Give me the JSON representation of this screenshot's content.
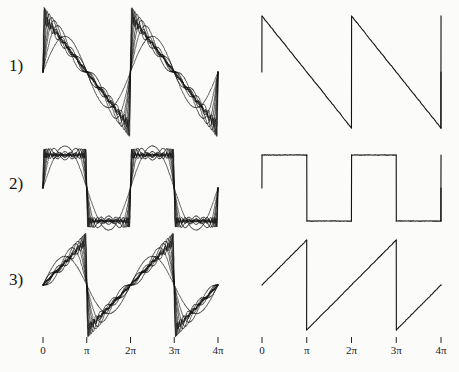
{
  "figure": {
    "background_color": "#fbfbfa",
    "ink_color": "#111111",
    "rows": [
      {
        "label": "1)",
        "name": "falling-sawtooth",
        "left_caption": "Fourier partial sums of a falling sawtooth wave showing Gibbs overshoot",
        "right_caption": "Ideal falling sawtooth wave"
      },
      {
        "label": "2)",
        "name": "square-wave",
        "left_caption": "Fourier partial sums of a square wave showing Gibbs overshoot",
        "right_caption": "Ideal square wave"
      },
      {
        "label": "3)",
        "name": "rising-sawtooth",
        "left_caption": "Fourier partial sums of a rising sawtooth wave showing Gibbs overshoot",
        "right_caption": "Ideal rising sawtooth wave"
      }
    ],
    "axis": {
      "tick_labels": [
        "0",
        "π",
        "2π",
        "3π",
        "4π"
      ],
      "tick_values": [
        0,
        3.14159,
        6.28319,
        9.42478,
        12.56637
      ],
      "xlabel": "",
      "ylabel": ""
    }
  },
  "chart_data": [
    {
      "id": "row1-left",
      "type": "line",
      "title": "",
      "xlabel": "",
      "ylabel": "",
      "xlim": [
        0,
        12.56637
      ],
      "ylim": [
        -1.35,
        1.35
      ],
      "grid": false,
      "legend": null,
      "xticks": [
        0,
        3.14159,
        6.28319,
        9.42478,
        12.56637
      ],
      "xticklabels": [
        "0",
        "π",
        "2π",
        "3π",
        "4π"
      ],
      "description": "Fourier series partial sums (N = 1,2,3,5,8,13,21,34) converging to a falling sawtooth wave, period 2π, with visible Gibbs phenomenon spikes at the jump discontinuities",
      "waveform": "falling-sawtooth",
      "period": 6.28319,
      "amplitude": 1.0,
      "harmonics": [
        1,
        2,
        3,
        5,
        8,
        13,
        21,
        34
      ]
    },
    {
      "id": "row1-right",
      "type": "line",
      "title": "",
      "xlabel": "",
      "ylabel": "",
      "xlim": [
        0,
        12.56637
      ],
      "ylim": [
        -1.35,
        1.35
      ],
      "grid": false,
      "legend": null,
      "xticks": [
        0,
        3.14159,
        6.28319,
        9.42478,
        12.56637
      ],
      "xticklabels": [
        "0",
        "π",
        "2π",
        "3π",
        "4π"
      ],
      "description": "Ideal falling sawtooth wave, period 2π, rising jump at x = 0, 2π, 4π then linear decrease",
      "waveform": "falling-sawtooth",
      "period": 6.28319,
      "amplitude": 1.0,
      "points": [
        [
          0.0,
          0.0
        ],
        [
          0.0,
          1.0
        ],
        [
          6.28319,
          -1.0
        ],
        [
          6.28319,
          1.0
        ],
        [
          12.56637,
          -1.0
        ],
        [
          12.56637,
          0.0
        ]
      ]
    },
    {
      "id": "row2-left",
      "type": "line",
      "title": "",
      "xlabel": "",
      "ylabel": "",
      "xlim": [
        0,
        12.56637
      ],
      "ylim": [
        -1.35,
        1.35
      ],
      "grid": false,
      "legend": null,
      "xticks": [
        0,
        3.14159,
        6.28319,
        9.42478,
        12.56637
      ],
      "xticklabels": [
        "0",
        "π",
        "2π",
        "3π",
        "4π"
      ],
      "description": "Fourier series partial sums (odd harmonics N = 1,3,5,9,15,25,41) converging to a square wave with Gibbs overshoot at each transition",
      "waveform": "square",
      "period": 6.28319,
      "amplitude": 1.0,
      "harmonics": [
        1,
        3,
        5,
        9,
        15,
        25,
        41
      ]
    },
    {
      "id": "row2-right",
      "type": "line",
      "title": "",
      "xlabel": "",
      "ylabel": "",
      "xlim": [
        0,
        12.56637
      ],
      "ylim": [
        -1.35,
        1.35
      ],
      "grid": false,
      "legend": null,
      "xticks": [
        0,
        3.14159,
        6.28319,
        9.42478,
        12.56637
      ],
      "xticklabels": [
        "0",
        "π",
        "2π",
        "3π",
        "4π"
      ],
      "description": "Ideal square wave, period 2π, value +1 on (0,π) and -1 on (π,2π)",
      "waveform": "square",
      "period": 6.28319,
      "amplitude": 1.0,
      "points": [
        [
          0.0,
          0.0
        ],
        [
          0.0,
          1.0
        ],
        [
          3.14159,
          1.0
        ],
        [
          3.14159,
          -1.0
        ],
        [
          6.28319,
          -1.0
        ],
        [
          6.28319,
          1.0
        ],
        [
          9.42478,
          1.0
        ],
        [
          9.42478,
          -1.0
        ],
        [
          12.56637,
          -1.0
        ],
        [
          12.56637,
          0.0
        ]
      ]
    },
    {
      "id": "row3-left",
      "type": "line",
      "title": "",
      "xlabel": "",
      "ylabel": "",
      "xlim": [
        0,
        12.56637
      ],
      "ylim": [
        -1.35,
        1.35
      ],
      "grid": false,
      "legend": null,
      "xticks": [
        0,
        3.14159,
        6.28319,
        9.42478,
        12.56637
      ],
      "xticklabels": [
        "0",
        "π",
        "2π",
        "3π",
        "4π"
      ],
      "description": "Fourier series partial sums (N = 1,2,3,5,8,13,21,34) converging to a rising sawtooth wave with Gibbs spikes at the drops",
      "waveform": "rising-sawtooth",
      "period": 6.28319,
      "amplitude": 1.0,
      "harmonics": [
        1,
        2,
        3,
        5,
        8,
        13,
        21,
        34
      ]
    },
    {
      "id": "row3-right",
      "type": "line",
      "title": "",
      "xlabel": "",
      "ylabel": "",
      "xlim": [
        0,
        12.56637
      ],
      "ylim": [
        -1.35,
        1.35
      ],
      "grid": false,
      "legend": null,
      "xticks": [
        0,
        3.14159,
        6.28319,
        9.42478,
        12.56637
      ],
      "xticklabels": [
        "0",
        "π",
        "2π",
        "3π",
        "4π"
      ],
      "description": "Ideal rising sawtooth wave, period 2π, linear increase with falling jumps at x = π, 3π",
      "waveform": "rising-sawtooth",
      "period": 6.28319,
      "amplitude": 1.0,
      "points": [
        [
          0.0,
          0.0
        ],
        [
          3.14159,
          1.0
        ],
        [
          3.14159,
          -1.0
        ],
        [
          9.42478,
          1.0
        ],
        [
          9.42478,
          -1.0
        ],
        [
          12.56637,
          0.0
        ]
      ]
    }
  ]
}
